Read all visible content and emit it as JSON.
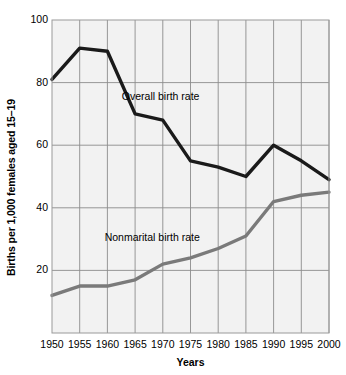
{
  "chart_data": {
    "type": "line",
    "title": "",
    "xlabel": "Years",
    "ylabel": "Births per 1,000 females aged 15–19",
    "x": [
      1950,
      1955,
      1960,
      1965,
      1970,
      1975,
      1980,
      1985,
      1990,
      1995,
      2000
    ],
    "xtick_labels": [
      "1950",
      "1955",
      "1960",
      "1965",
      "1970",
      "1975",
      "1980",
      "1985",
      "1990",
      "1995",
      "2000"
    ],
    "xlim": [
      1950,
      2000
    ],
    "ylim": [
      0,
      100
    ],
    "ytick_labels": [
      "20",
      "40",
      "60",
      "80",
      "100"
    ],
    "yticks": [
      20,
      40,
      60,
      80,
      100
    ],
    "grid": true,
    "legend_position": "inline-annotations",
    "series": [
      {
        "name": "Overall birth rate",
        "color": "#1a1a1a",
        "values": [
          81,
          91,
          90,
          70,
          68,
          55,
          53,
          50,
          60,
          55,
          49
        ]
      },
      {
        "name": "Nonmarital birth rate",
        "color": "#7a7a7a",
        "values": [
          12,
          15,
          15,
          17,
          22,
          24,
          27,
          31,
          42,
          44,
          45
        ]
      }
    ],
    "annotations": [
      {
        "text": "Overall birth rate",
        "x": 1962.6,
        "y": 75.5
      },
      {
        "text": "Nonmarital birth rate",
        "x": 1959.5,
        "y": 30.5
      }
    ],
    "style": {
      "plot_background": "#f2f2f2",
      "grid_color": "#8c8c8c",
      "border_color": "#9a9a9a",
      "page_background": "#ffffff"
    }
  }
}
